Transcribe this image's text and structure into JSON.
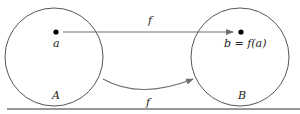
{
  "diagram": {
    "sets": [
      {
        "name": "A",
        "cx": 54,
        "cy": 57,
        "r": 49
      },
      {
        "name": "B",
        "cx": 240,
        "cy": 57,
        "r": 49
      }
    ],
    "points": [
      {
        "label": "a",
        "x": 56,
        "y": 32
      },
      {
        "label": "b = f(a)",
        "x": 241,
        "y": 32
      }
    ],
    "arrows": [
      {
        "label": "f",
        "type": "straight"
      },
      {
        "label": "f",
        "type": "curved"
      }
    ],
    "colors": {
      "stroke": "#555555",
      "arrow": "#6e6e6e",
      "dot": "#000000",
      "rule": "#333333"
    }
  }
}
